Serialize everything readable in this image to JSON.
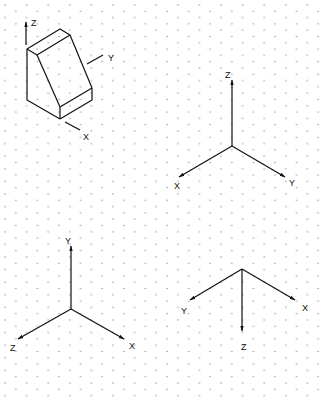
{
  "drawing": {
    "grid": {
      "type": "isometric-dots",
      "dot_color": "#8a8a8a"
    },
    "line_color": "#111111",
    "block": {
      "description": "isometric wedge block",
      "axis_labels": {
        "z": "Z",
        "y": "Y",
        "x": "X"
      }
    },
    "triads": [
      {
        "id": "triad-top-right",
        "labels": {
          "z": "Z",
          "x": "X",
          "y": "Y"
        }
      },
      {
        "id": "triad-bottom-left",
        "labels": {
          "y": "Y",
          "z": "Z",
          "x": "X"
        }
      },
      {
        "id": "triad-bottom-right",
        "labels": {
          "y": "Y",
          "x": "X",
          "z": "Z"
        }
      }
    ]
  }
}
